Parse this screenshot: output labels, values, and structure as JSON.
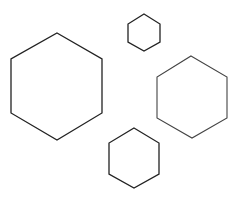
{
  "canvas": {
    "width": 238,
    "height": 197,
    "background": "#ffffff"
  },
  "shapes": [
    {
      "name": "large-hexagon",
      "points": "57,33 102,59 102,113 57,140 11,113 11,59",
      "stroke": "#222222",
      "stroke_width": 1.3
    },
    {
      "name": "small-hexagon",
      "points": "144,14 160,24 160,42 144,51 128,42 128,24",
      "stroke": "#222222",
      "stroke_width": 1.3
    },
    {
      "name": "right-hexagon",
      "points": "191,56 227,77 227,118 192,138 157,118 157,77",
      "stroke": "#444444",
      "stroke_width": 1.1
    },
    {
      "name": "bottom-hexagon",
      "points": "134,128 159,143 159,174 134,188 109,174 109,143",
      "stroke": "#222222",
      "stroke_width": 1.3
    }
  ]
}
